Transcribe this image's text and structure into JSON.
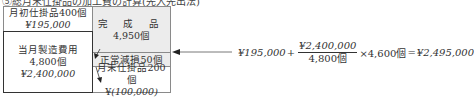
{
  "caption": "⑤総月末仕掛品の加工費の計算(先入先出法)",
  "diagram": {
    "beginning_wip": {
      "label": "月初仕掛品400個",
      "amount": "¥195,000"
    },
    "current_cost": {
      "label": "当月製造費用",
      "units": "4,800個",
      "amount": "¥2,400,000"
    },
    "completed": {
      "label": "完 成 品",
      "units": "4,950個"
    },
    "normal_loss": {
      "label": "正常減損50個"
    },
    "ending_wip": {
      "label": "月末仕掛品200個",
      "amount_prefix": "¥",
      "amount": "(100,000)"
    }
  },
  "formula": {
    "term1": "¥195,000",
    "plus": "+",
    "numerator": "¥2,400,000",
    "denominator": "4,800個",
    "times": "×4,600個",
    "equals": "=",
    "result": "¥2,495,000"
  },
  "colors": {
    "box_fill": "#ececec",
    "border": "#8a8a8a",
    "bold_border": "#333333"
  }
}
